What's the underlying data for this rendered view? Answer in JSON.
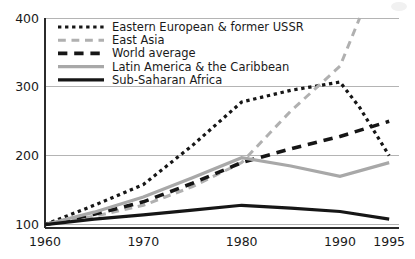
{
  "chart_data": {
    "type": "line",
    "title": "",
    "subtitle": "",
    "xlabel": "",
    "ylabel": "",
    "xlim": [
      1960,
      1996
    ],
    "ylim": [
      95,
      400
    ],
    "x_ticks": [
      1960,
      1970,
      1980,
      1990,
      1995
    ],
    "x_tick_labels": [
      "1960",
      "1970",
      "1980",
      "1990",
      "1995"
    ],
    "y_ticks": [
      100,
      200,
      300,
      400
    ],
    "y_tick_labels": [
      "100",
      "200",
      "300",
      "400"
    ],
    "grid": "horizontal",
    "legend_position": "top-left",
    "index_base": 100,
    "series": [
      {
        "name": "Eastern European & former USSR",
        "color": "#161616",
        "style": "dotted",
        "width": 3.2,
        "x": [
          1960,
          1965,
          1970,
          1975,
          1980,
          1985,
          1990,
          1992,
          1995
        ],
        "values": [
          100,
          128,
          158,
          215,
          278,
          295,
          307,
          270,
          200
        ]
      },
      {
        "name": "East Asia",
        "color": "#b0b0b0",
        "style": "dashed",
        "width": 3.0,
        "x": [
          1960,
          1965,
          1970,
          1975,
          1980,
          1985,
          1990,
          1992
        ],
        "values": [
          100,
          112,
          128,
          155,
          190,
          265,
          330,
          400
        ]
      },
      {
        "name": "World average",
        "color": "#161616",
        "style": "dashed",
        "width": 3.6,
        "x": [
          1960,
          1965,
          1970,
          1975,
          1980,
          1985,
          1990,
          1995
        ],
        "values": [
          100,
          115,
          133,
          160,
          190,
          210,
          228,
          250
        ]
      },
      {
        "name": "Latin America & the Caribbean",
        "color": "#a8a8a8",
        "style": "solid",
        "width": 3.2,
        "x": [
          1960,
          1965,
          1970,
          1975,
          1980,
          1985,
          1990,
          1995
        ],
        "values": [
          100,
          118,
          140,
          168,
          197,
          185,
          170,
          190
        ]
      },
      {
        "name": "Sub-Saharan Africa",
        "color": "#161616",
        "style": "solid",
        "width": 3.2,
        "x": [
          1960,
          1965,
          1970,
          1975,
          1980,
          1985,
          1990,
          1995
        ],
        "values": [
          100,
          108,
          114,
          121,
          128,
          124,
          119,
          108
        ]
      }
    ]
  },
  "legend": {
    "items": [
      {
        "label": "Eastern European & former USSR"
      },
      {
        "label": "East Asia"
      },
      {
        "label": "World average"
      },
      {
        "label": "Latin America & the Caribbean"
      },
      {
        "label": "Sub-Saharan Africa"
      }
    ]
  }
}
